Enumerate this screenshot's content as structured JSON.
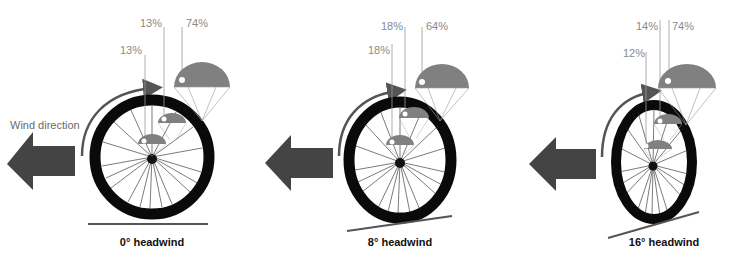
{
  "wind_label": "Wind direction",
  "colors": {
    "arrow": "#444444",
    "parachute": "#808080",
    "tire": "#0a0a0a",
    "leader_line": "#999999",
    "ground": "#555555"
  },
  "panels": [
    {
      "caption": "0° headwind",
      "angle_deg": 0,
      "percentages": {
        "small": "13%",
        "medium": "13%",
        "large": "74%"
      }
    },
    {
      "caption": "8° headwind",
      "angle_deg": 8,
      "percentages": {
        "small": "18%",
        "medium": "18%",
        "large": "64%"
      }
    },
    {
      "caption": "16° headwind",
      "angle_deg": 16,
      "percentages": {
        "small": "12%",
        "medium": "14%",
        "large": "74%"
      }
    }
  ]
}
